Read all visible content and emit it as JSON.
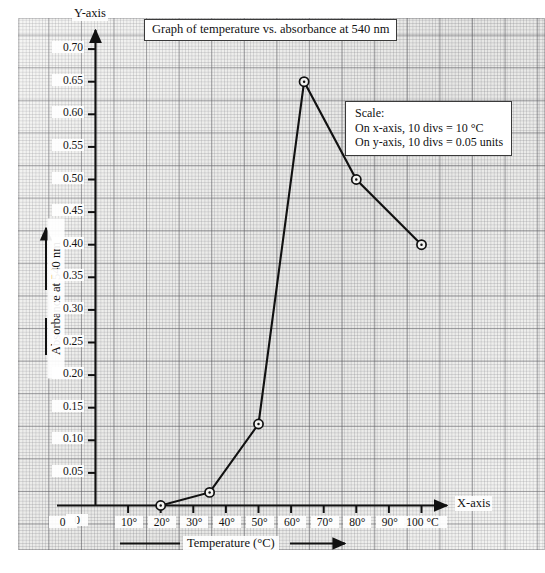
{
  "figure": {
    "title": "Graph of temperature vs. absorbance at 540 nm",
    "y_axis_name": "Y-axis",
    "x_axis_name": "X-axis",
    "y_caption": "Absorbance at 540 nm",
    "x_caption": "Temperature (°C)",
    "scale": {
      "heading": "Scale:",
      "x_line": "On x-axis, 10 divs = 10 °C",
      "y_line": "On y-axis, 10 divs = 0.05 units"
    },
    "colors": {
      "paper": "#f3f3f1",
      "grid_minor": "#82828a",
      "grid_major": "#5a5a5f",
      "ink": "#111111",
      "curve": "#111111"
    }
  },
  "chart_data": {
    "type": "line",
    "title": "Graph of temperature vs. absorbance at 540 nm",
    "xlabel": "Temperature (°C)",
    "ylabel": "Absorbance at 540 nm",
    "xlim": [
      0,
      105
    ],
    "ylim": [
      0,
      0.725
    ],
    "grid": true,
    "legend": "none",
    "x_tick_labels": [
      "0",
      "10°",
      "20°",
      "30°",
      "40°",
      "50°",
      "60°",
      "70°",
      "80°",
      "90°",
      "100 °C"
    ],
    "x_tick_values": [
      0,
      10,
      20,
      30,
      40,
      50,
      60,
      70,
      80,
      90,
      100
    ],
    "y_tick_labels": [
      "0",
      "0.05",
      "0.10",
      "0.15",
      "0.20",
      "0.25",
      "0.30",
      "0.35",
      "0.40",
      "0.45",
      "0.50",
      "0.55",
      "0.60",
      "0.65",
      "0.70"
    ],
    "y_tick_values": [
      0,
      0.05,
      0.1,
      0.15,
      0.2,
      0.25,
      0.3,
      0.35,
      0.4,
      0.45,
      0.5,
      0.55,
      0.6,
      0.65,
      0.7
    ],
    "x": [
      20,
      35,
      50,
      64,
      80,
      100
    ],
    "values": [
      0.0,
      0.02,
      0.125,
      0.65,
      0.5,
      0.4
    ],
    "marker": "circle-with-dot",
    "annotations": [
      "Scale:",
      "On x-axis, 10 divs = 10 °C",
      "On y-axis, 10 divs = 0.05 units"
    ]
  }
}
